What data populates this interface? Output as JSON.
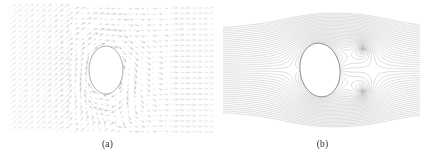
{
  "figure": {
    "width": 430,
    "height": 161,
    "background": "#ffffff",
    "line_color": "#9a9a9a",
    "arrow_color": "#a8a8a8",
    "body_outline_color": "#8c8c8c",
    "body_fill": "#ffffff",
    "caption_color": "#2b2b2b"
  },
  "panels": [
    {
      "id": "a",
      "caption": "(a)",
      "kind": "vector-field",
      "corner_label": "",
      "body": {
        "shape": "ellipse",
        "center_x": 106,
        "center_y": 70,
        "radius_x": 17,
        "radius_y": 24,
        "tilt_deg": 0
      }
    },
    {
      "id": "b",
      "caption": "(b)",
      "kind": "contour-field",
      "corner_label": "",
      "body": {
        "shape": "ellipse",
        "center_x": 105,
        "center_y": 70,
        "radius_x": 20,
        "radius_y": 27,
        "tilt_deg": -8
      }
    }
  ],
  "chart_data": [
    {
      "type": "scatter",
      "title": "(a)",
      "subtitle": "Velocity vector field around an elliptical body",
      "xlabel": "",
      "ylabel": "",
      "xlim": [
        -3.2,
        3.2
      ],
      "ylim": [
        -2.1,
        2.1
      ],
      "grid": false,
      "legend": "none",
      "annotations": [
        "(a)"
      ],
      "field": {
        "representation": "quiver",
        "grid_nx": 34,
        "grid_ny": 24,
        "arrow_head": "open-v",
        "obstacle": {
          "type": "ellipse",
          "cx": 0.0,
          "cy": 0.0,
          "a": 0.5,
          "b": 0.72
        },
        "freestream_u": 1.0,
        "freestream_v": 0.0,
        "circulation": -2.2,
        "description": "Potential-flow style velocity vectors forming concentric elliptical rings around a blocked ellipse; upstream-left vectors incline up-right, far-right vectors become nearly horizontal."
      }
    },
    {
      "type": "line",
      "title": "(b)",
      "subtitle": "Contour lines (isolines) of the flow field around the same elliptical body",
      "xlabel": "",
      "ylabel": "",
      "xlim": [
        -3.2,
        3.2
      ],
      "ylim": [
        -2.1,
        2.1
      ],
      "grid": false,
      "legend": "none",
      "annotations": [
        "(b)"
      ],
      "contours": {
        "n_levels": 46,
        "level_min": -1.15,
        "level_max": 1.15,
        "level_step": 0.05,
        "obstacle": {
          "type": "ellipse",
          "cx": -0.35,
          "cy": 0.0,
          "a": 0.58,
          "b": 0.78
        },
        "critical_points": [
          {
            "kind": "vortex-center",
            "x": 1.25,
            "y": 0.62
          },
          {
            "kind": "vortex-center",
            "x": 1.25,
            "y": -0.62
          },
          {
            "kind": "saddle",
            "x": 1.25,
            "y": 0.0
          },
          {
            "kind": "stagnation",
            "x": -1.02,
            "y": 0.0
          },
          {
            "kind": "small-closed-loop",
            "x": 0.15,
            "y": 0.72
          }
        ],
        "description": "Dense contour bundle radiating from the left stagnation region, wrapping the ellipse, and closing into two counter-rotating concentric vortex eyes downstream on the right."
      }
    }
  ]
}
